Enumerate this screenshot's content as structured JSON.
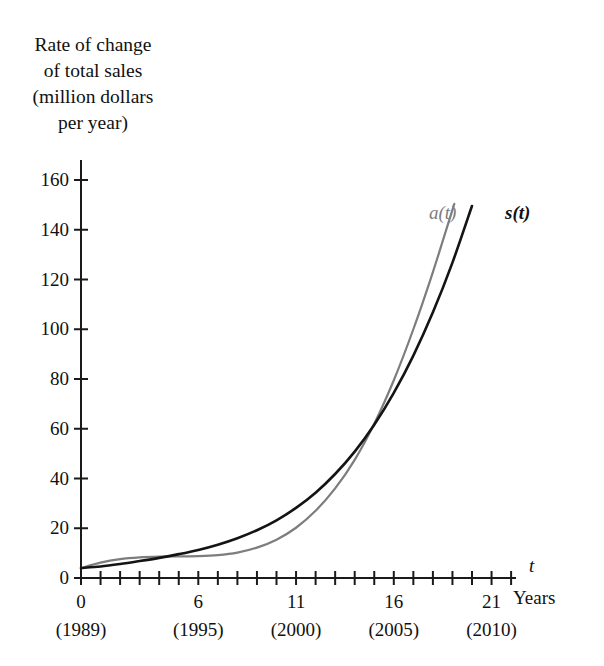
{
  "figure": {
    "background": "#ffffff",
    "y_axis_caption_lines": [
      "Rate of change",
      "of total sales",
      "(million dollars",
      "per year)"
    ],
    "x_axis_variable": "t",
    "x_axis_units": "Years"
  },
  "chart_data": {
    "type": "line",
    "title": "",
    "xlabel": "t  (Years)",
    "ylabel": "Rate of change of total sales (million dollars per year)",
    "xlim": [
      0,
      22.2
    ],
    "ylim": [
      0,
      168
    ],
    "grid": false,
    "legend": "inline-curve-labels",
    "x_tick_labels": [
      "0",
      "6",
      "11",
      "16",
      "21"
    ],
    "x_tick_values": [
      0,
      6,
      11,
      16,
      21
    ],
    "x_tick_sublabels": [
      "(1989)",
      "(1995)",
      "(2000)",
      "(2005)",
      "(2010)"
    ],
    "x_minor_tick_interval": 1,
    "y_tick_labels": [
      "0",
      "20",
      "40",
      "60",
      "80",
      "100",
      "120",
      "140",
      "160"
    ],
    "y_tick_values": [
      0,
      20,
      40,
      60,
      80,
      100,
      120,
      140,
      160
    ],
    "x": [
      0,
      1,
      2,
      3,
      4,
      5,
      6,
      7,
      8,
      9,
      10,
      11,
      12,
      13,
      14,
      15,
      16,
      17,
      18,
      19,
      20,
      21
    ],
    "series": [
      {
        "name": "a(t)",
        "label": "a(t)",
        "color": "#7d7d7d",
        "linewidth": 2.2,
        "values": [
          4.0,
          6.2,
          7.6,
          8.3,
          8.6,
          8.7,
          8.8,
          9.2,
          10.2,
          12.2,
          15.4,
          20.2,
          27.0,
          36.0,
          47.5,
          62.0,
          79.5,
          100.0,
          123.0,
          148.0,
          175.0,
          204.0
        ]
      },
      {
        "name": "s(t)",
        "label": "s(t)",
        "color": "#141414",
        "linewidth": 2.6,
        "values": [
          4.0,
          4.6,
          5.6,
          6.8,
          8.1,
          9.6,
          11.3,
          13.4,
          16.0,
          19.2,
          23.2,
          28.2,
          34.3,
          41.8,
          50.8,
          61.6,
          74.4,
          89.4,
          106.8,
          126.8,
          149.6,
          175.0
        ]
      }
    ],
    "annotations": [
      {
        "text": "a(t)",
        "x": 19.3,
        "y": 152,
        "color": "#7d7d7d",
        "style": "italic"
      },
      {
        "text": "s(t)",
        "x": 21.7,
        "y": 152,
        "color": "#141414",
        "style": "bold-italic"
      }
    ]
  }
}
